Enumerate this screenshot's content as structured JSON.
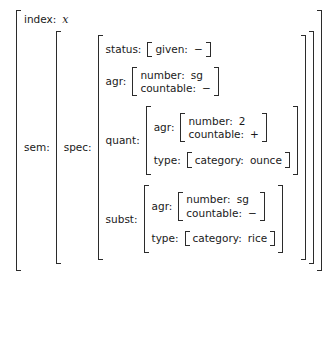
{
  "diagram": {
    "kind": "attribute-value-matrix",
    "title": "",
    "colors": {
      "ink": "#1a1a1a",
      "bracket": "#2b2b2b",
      "background": "#ffffff"
    }
  },
  "labels": {
    "index": "index:",
    "sem": "sem:",
    "spec": "spec:",
    "status": "status:",
    "given": "given:",
    "agr": "agr:",
    "number": "number:",
    "countable": "countable:",
    "quant": "quant:",
    "type": "type:",
    "category": "category:",
    "subst": "subst:"
  },
  "values": {
    "index_var": "x",
    "status_given": "−",
    "top_agr_number": "sg",
    "top_agr_countable": "−",
    "quant_agr_number": "2",
    "quant_agr_countable": "+",
    "quant_type_category": "ounce",
    "subst_agr_number": "sg",
    "subst_agr_countable": "−",
    "subst_type_category": "rice"
  }
}
